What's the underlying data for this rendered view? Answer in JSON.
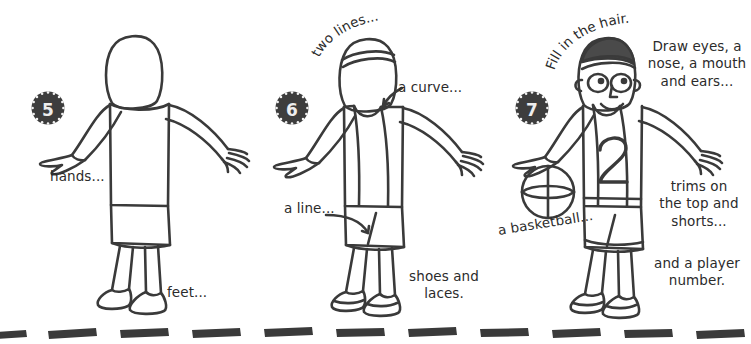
{
  "page": {
    "ink_color": "#3a3a3a",
    "text_color": "#2b2b2b",
    "badge_color": "#3d3d3d",
    "background": "#ffffff"
  },
  "steps": [
    {
      "number": "5",
      "badge_name": "step-5-badge",
      "captions": [
        {
          "name": "caption-hands",
          "text": "hands..."
        },
        {
          "name": "caption-feet",
          "text": "feet..."
        }
      ]
    },
    {
      "number": "6",
      "badge_name": "step-6-badge",
      "captions": [
        {
          "name": "caption-two-lines",
          "text": "two lines..."
        },
        {
          "name": "caption-a-curve",
          "text": "a curve..."
        },
        {
          "name": "caption-a-line",
          "text": "a line..."
        },
        {
          "name": "caption-shoes-and-laces-1",
          "text": "shoes and"
        },
        {
          "name": "caption-shoes-and-laces-2",
          "text": "laces."
        }
      ]
    },
    {
      "number": "7",
      "badge_name": "step-7-badge",
      "captions": [
        {
          "name": "caption-fill-in-the-hair",
          "text": "Fill in the hair."
        },
        {
          "name": "caption-draw-face-1",
          "text": "Draw eyes, a"
        },
        {
          "name": "caption-draw-face-2",
          "text": "nose, a mouth"
        },
        {
          "name": "caption-draw-face-3",
          "text": "and ears..."
        },
        {
          "name": "caption-basketball",
          "text": "a basketball..."
        },
        {
          "name": "caption-trims-1",
          "text": "trims on"
        },
        {
          "name": "caption-trims-2",
          "text": "the top and"
        },
        {
          "name": "caption-trims-3",
          "text": "shorts..."
        },
        {
          "name": "caption-player-number-1",
          "text": "and a player"
        },
        {
          "name": "caption-player-number-2",
          "text": "number."
        }
      ],
      "jersey_number": "2"
    }
  ]
}
